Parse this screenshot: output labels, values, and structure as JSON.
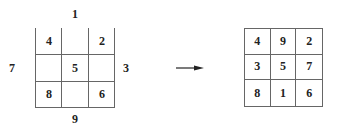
{
  "left_square": {
    "outer_labels": {
      "top": "1",
      "left": "7",
      "right": "3",
      "bottom": "9"
    },
    "cells": [
      "4",
      "",
      "2",
      "",
      "5",
      "",
      "8",
      "",
      "6"
    ]
  },
  "arrow": "right-arrow",
  "right_square": {
    "cells": [
      "4",
      "9",
      "2",
      "3",
      "5",
      "7",
      "8",
      "1",
      "6"
    ]
  }
}
